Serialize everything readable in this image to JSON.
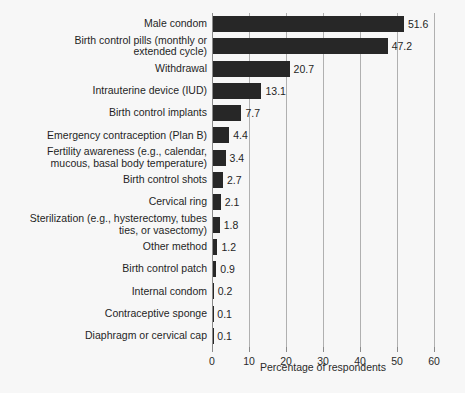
{
  "chart_data": {
    "type": "bar",
    "orientation": "horizontal",
    "title": "",
    "xlabel": "Percentage of respondents",
    "ylabel": "",
    "xlim": [
      0,
      60
    ],
    "xticks": [
      0,
      10,
      20,
      30,
      40,
      50,
      60
    ],
    "xtick_labels": [
      "0",
      "10",
      "20",
      "30",
      "40",
      "50",
      "60"
    ],
    "grid": true,
    "legend": false,
    "bar_color": "#272727",
    "background_color": "#f7f7f7",
    "gridline_color": "#b0b0b0",
    "categories": [
      "Male condom",
      "Birth control pills (monthly or\nextended cycle)",
      "Withdrawal",
      "Intrauterine device (IUD)",
      "Birth control implants",
      "Emergency contraception (Plan B)",
      "Fertility awareness (e.g., calendar,\nmucous, basal body temperature)",
      "Birth control shots",
      "Cervical ring",
      "Sterilization (e.g., hysterectomy, tubes\nties, or vasectomy)",
      "Other method",
      "Birth control patch",
      "Internal condom",
      "Contraceptive sponge",
      "Diaphragm or cervical cap"
    ],
    "values": [
      51.6,
      47.2,
      20.7,
      13.1,
      7.7,
      4.4,
      3.4,
      2.7,
      2.1,
      1.8,
      1.2,
      0.9,
      0.2,
      0.1,
      0.1
    ],
    "value_labels": [
      "51.6",
      "47.2",
      "20.7",
      "13.1",
      "7.7",
      "4.4",
      "3.4",
      "2.7",
      "2.1",
      "1.8",
      "1.2",
      "0.9",
      "0.2",
      "0.1",
      "0.1"
    ]
  }
}
